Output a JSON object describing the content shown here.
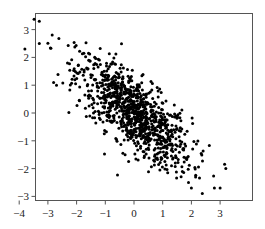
{
  "chart_data": {
    "type": "scatter",
    "title": "",
    "xlabel": "",
    "ylabel": "",
    "xlim": [
      -4.1,
      3.5
    ],
    "ylim": [
      -3.1,
      3.5
    ],
    "xticks": [
      -4,
      -3,
      -2,
      -1,
      0,
      1,
      2,
      3
    ],
    "yticks": [
      -3,
      -2,
      -1,
      0,
      1,
      2,
      3
    ],
    "grid": false,
    "legend": null,
    "series": [
      {
        "name": "samples",
        "color": "#000000",
        "distribution": {
          "kind": "bivariate_normal",
          "n": 1000,
          "mean": [
            0,
            0
          ],
          "sd": [
            1,
            1
          ],
          "correlation": -0.75
        },
        "notable_points": [
          {
            "x": -3.8,
            "y": 2.3
          },
          {
            "x": -3.3,
            "y": 3.3
          },
          {
            "x": -3.3,
            "y": 2.5
          },
          {
            "x": -2.8,
            "y": 1.1
          },
          {
            "x": -2.7,
            "y": 1.0
          },
          {
            "x": 3.2,
            "y": -2.0
          },
          {
            "x": 2.8,
            "y": -2.7
          },
          {
            "x": 2.0,
            "y": -2.7
          },
          {
            "x": 1.9,
            "y": -2.5
          },
          {
            "x": 3.0,
            "y": -2.7
          }
        ]
      }
    ]
  }
}
